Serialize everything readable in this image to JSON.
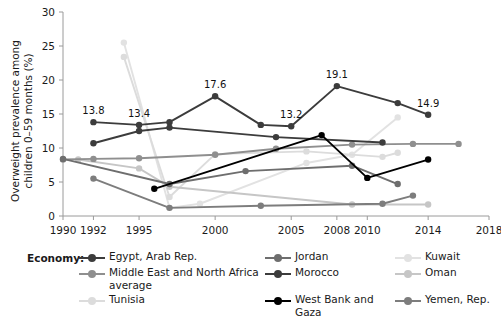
{
  "chart_data": {
    "type": "line",
    "title": "",
    "xlabel": "",
    "ylabel": "Overweight prevalence among\nchildren 0–59 months (%)",
    "xlim": [
      1990,
      2018
    ],
    "ylim": [
      0,
      30
    ],
    "ytick_labels": [
      "0",
      "5",
      "10",
      "15",
      "20",
      "25",
      "30"
    ],
    "ytick_values": [
      0,
      5,
      10,
      15,
      20,
      25,
      30
    ],
    "xtick_labels": [
      "1990",
      "1992",
      "1995",
      "2000",
      "2005",
      "2008",
      "2010",
      "2014",
      "2018"
    ],
    "xtick_values": [
      1990,
      1992,
      1995,
      2000,
      2005,
      2008,
      2010,
      2014,
      2018
    ],
    "grid": false,
    "legend_position": "bottom",
    "legend_title": "Economy:",
    "series": [
      {
        "name": "Egypt, Arab Rep.",
        "color": "#3c3c3c",
        "x": [
          1992,
          1995,
          1997,
          2000,
          2003,
          2005,
          2008,
          2012,
          2014
        ],
        "y": [
          13.8,
          13.4,
          13.8,
          17.6,
          13.4,
          13.2,
          19.1,
          16.6,
          14.9
        ],
        "labels": [
          {
            "x": 1992,
            "y": 13.8,
            "text": "13.8"
          },
          {
            "x": 1995,
            "y": 13.4,
            "text": "13.4"
          },
          {
            "x": 2000,
            "y": 17.6,
            "text": "17.6"
          },
          {
            "x": 2005,
            "y": 13.2,
            "text": "13.2"
          },
          {
            "x": 2008,
            "y": 19.1,
            "text": "19.1"
          },
          {
            "x": 2014,
            "y": 14.9,
            "text": "14.9"
          }
        ]
      },
      {
        "name": "Jordan",
        "color": "#6e6e6e",
        "x": [
          1990,
          1997,
          2002,
          2009,
          2012
        ],
        "y": [
          8.4,
          4.7,
          6.6,
          7.4,
          4.7
        ],
        "labels": []
      },
      {
        "name": "Kuwait",
        "color": "#e2e2e2",
        "x": [
          1994,
          1997,
          1999,
          2006,
          2009,
          2012
        ],
        "y": [
          25.5,
          1.2,
          1.8,
          7.8,
          9.0,
          14.5
        ],
        "labels": []
      },
      {
        "name": "Middle East and North Africa\naverage",
        "color": "#8f8f8f",
        "x": [
          1990,
          1992,
          1995,
          2000,
          2004,
          2009,
          2013,
          2016
        ],
        "y": [
          8.3,
          8.4,
          8.5,
          9.0,
          9.9,
          10.5,
          10.6,
          10.6
        ],
        "labels": []
      },
      {
        "name": "Morocco",
        "color": "#3c3c3c",
        "x": [
          1992,
          1995,
          1997,
          2004,
          2011
        ],
        "y": [
          10.7,
          12.5,
          13.0,
          11.6,
          10.8
        ],
        "labels": []
      },
      {
        "name": "Oman",
        "color": "#c6c6c6",
        "x": [
          1991,
          1995,
          1997,
          2009,
          2014
        ],
        "y": [
          8.3,
          7.0,
          4.3,
          1.7,
          1.7
        ],
        "labels": []
      },
      {
        "name": "Tunisia",
        "color": "#dcdcdc",
        "x": [
          1994,
          1997,
          2000,
          2006,
          2011,
          2012
        ],
        "y": [
          23.4,
          2.8,
          9.1,
          9.5,
          8.7,
          9.3
        ],
        "labels": []
      },
      {
        "name": "West Bank and Gaza",
        "color": "#000000",
        "x": [
          1996,
          2007,
          2010,
          2014
        ],
        "y": [
          4.0,
          11.9,
          5.6,
          8.3
        ],
        "labels": []
      },
      {
        "name": "Yemen, Rep.",
        "color": "#7d7d7d",
        "x": [
          1992,
          1997,
          2003,
          2011,
          2013
        ],
        "y": [
          5.5,
          1.2,
          1.5,
          1.8,
          3.0
        ],
        "labels": []
      }
    ]
  },
  "legend": {
    "title": "Economy:",
    "rows": [
      [
        {
          "name": "Egypt, Arab Rep.",
          "color": "#3c3c3c"
        },
        {
          "name": "Jordan",
          "color": "#6e6e6e"
        },
        {
          "name": "Kuwait",
          "color": "#e2e2e2"
        }
      ],
      [
        {
          "name": "Middle East and North Africa\naverage",
          "color": "#8f8f8f"
        },
        {
          "name": "Morocco",
          "color": "#3c3c3c"
        },
        {
          "name": "Oman",
          "color": "#c6c6c6"
        }
      ],
      [
        {
          "name": "Tunisia",
          "color": "#dcdcdc"
        },
        {
          "name": "West Bank and Gaza",
          "color": "#000000"
        },
        {
          "name": "Yemen, Rep.",
          "color": "#7d7d7d"
        }
      ]
    ]
  },
  "axis": {
    "y_title_line1": "Overweight prevalence among",
    "y_title_line2": "children 0–59 months (%)"
  }
}
